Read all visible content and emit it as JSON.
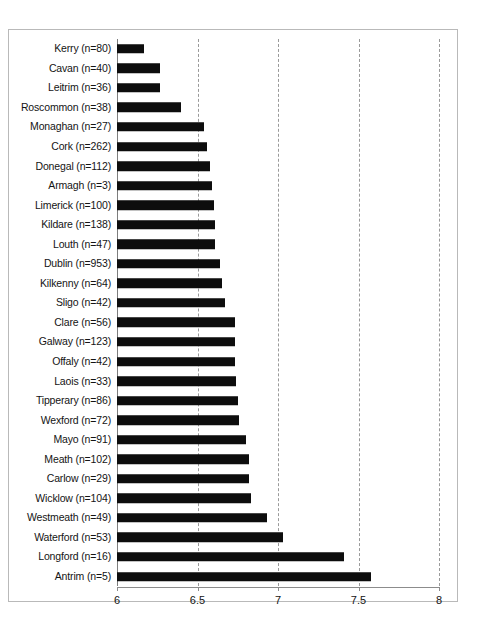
{
  "chart_data": {
    "type": "bar",
    "orientation": "horizontal",
    "title": "",
    "subtitle": "",
    "xlabel": "",
    "ylabel": "",
    "xlim": [
      6,
      8
    ],
    "ylim": null,
    "grid": true,
    "gridlines_x": [
      6,
      6.5,
      7,
      7.5,
      8
    ],
    "xticks": [
      6,
      6.5,
      7,
      7.5,
      8
    ],
    "xtick_labels": [
      "6",
      "6.5",
      "7",
      "7.5",
      "8"
    ],
    "legend": null,
    "legend_position": "none",
    "bar_color": "#0d0d0d",
    "categories": [
      "Kerry (n=80)",
      "Cavan (n=40)",
      "Leitrim (n=36)",
      "Roscommon (n=38)",
      "Monaghan (n=27)",
      "Cork (n=262)",
      "Donegal (n=112)",
      "Armagh (n=3)",
      "Limerick (n=100)",
      "Kildare (n=138)",
      "Louth (n=47)",
      "Dublin (n=953)",
      "Kilkenny (n=64)",
      "Sligo (n=42)",
      "Clare (n=56)",
      "Galway (n=123)",
      "Offaly (n=42)",
      "Laois (n=33)",
      "Tipperary (n=86)",
      "Wexford (n=72)",
      "Mayo (n=91)",
      "Meath (n=102)",
      "Carlow (n=29)",
      "Wicklow (n=104)",
      "Westmeath (n=49)",
      "Waterford (n=53)",
      "Longford (n=16)",
      "Antrim (n=5)"
    ],
    "values": [
      6.17,
      6.27,
      6.27,
      6.4,
      6.54,
      6.56,
      6.58,
      6.59,
      6.6,
      6.61,
      6.61,
      6.64,
      6.65,
      6.67,
      6.73,
      6.73,
      6.73,
      6.74,
      6.75,
      6.76,
      6.8,
      6.82,
      6.82,
      6.83,
      6.93,
      7.03,
      7.41,
      7.58
    ]
  }
}
